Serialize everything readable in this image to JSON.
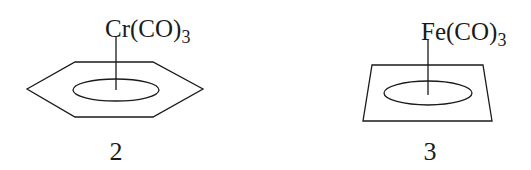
{
  "compounds": [
    {
      "metal_fragment": "Cr(CO)",
      "subscript": "3",
      "ring": "hexagon",
      "label": "2"
    },
    {
      "metal_fragment": "Fe(CO)",
      "subscript": "3",
      "ring": "quadrilateral",
      "label": "3"
    }
  ],
  "colors": {
    "stroke": "#1a1a1a",
    "background": "#ffffff"
  }
}
